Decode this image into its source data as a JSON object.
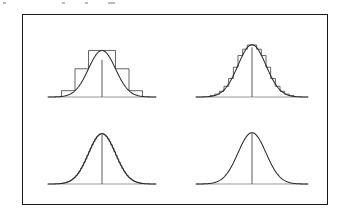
{
  "figure": {
    "domain_note": "statistical figure: normal density approximated by histograms of decreasing bin width",
    "border_color": "#1a1a1a",
    "curve_color": "#2b2b2b",
    "hist_color": "#4a4a4a",
    "axis_color": "#8c8c8c",
    "background_color": "#ffffff",
    "panel_count": 4
  },
  "caption_specks": [
    {
      "left": 3,
      "width": 3
    },
    {
      "left": 62,
      "width": 3
    },
    {
      "left": 85,
      "width": 3
    },
    {
      "left": 108,
      "width": 7
    }
  ],
  "chart_data": [
    {
      "id": "panel-top-left",
      "type": "area",
      "title": "",
      "xlabel": "",
      "ylabel": "",
      "position": "top-left",
      "grid": false,
      "legend": null,
      "axis_baseline_y": 0,
      "xlim": [
        -4,
        4
      ],
      "ylim": [
        0,
        0.42
      ],
      "curve": {
        "name": "normal density",
        "distribution": "normal",
        "mean": 0,
        "sd": 1,
        "peak_value": 0.3989
      },
      "center_line": {
        "x": 0,
        "y_top": 0.3192
      },
      "histogram": {
        "name": "coarse histogram",
        "bin_width": 1.0,
        "bin_count": 6,
        "bin_edges": [
          -3,
          -2,
          -1,
          0,
          1,
          2,
          3
        ],
        "bin_heights": [
          0.054,
          0.242,
          0.3989,
          0.3989,
          0.242,
          0.054
        ]
      }
    },
    {
      "id": "panel-top-right",
      "type": "area",
      "title": "",
      "xlabel": "",
      "ylabel": "",
      "position": "top-right",
      "grid": false,
      "legend": null,
      "axis_baseline_y": 0,
      "xlim": [
        -4,
        4
      ],
      "ylim": [
        0,
        0.42
      ],
      "curve": {
        "name": "normal density",
        "distribution": "normal",
        "mean": 0,
        "sd": 1,
        "peak_value": 0.3989
      },
      "center_line": {
        "x": 0,
        "y_top": 0.379
      },
      "histogram": {
        "name": "medium histogram",
        "bin_width": 0.3333,
        "bin_count": 18,
        "bin_edges": [
          -3.0,
          -2.667,
          -2.333,
          -2.0,
          -1.667,
          -1.333,
          -1.0,
          -0.667,
          -0.333,
          0.0,
          0.333,
          0.667,
          1.0,
          1.333,
          1.667,
          2.0,
          2.333,
          2.667,
          3.0
        ],
        "bin_heights": [
          0.0104,
          0.0219,
          0.044,
          0.0818,
          0.1417,
          0.2275,
          0.3166,
          0.3652,
          0.397,
          0.397,
          0.3652,
          0.3166,
          0.2275,
          0.1417,
          0.0818,
          0.044,
          0.0219,
          0.0104
        ]
      }
    },
    {
      "id": "panel-bottom-left",
      "type": "area",
      "title": "",
      "xlabel": "",
      "ylabel": "",
      "position": "bottom-left",
      "grid": false,
      "legend": null,
      "axis_baseline_y": 0,
      "xlim": [
        -4,
        4
      ],
      "ylim": [
        0,
        0.42
      ],
      "curve": {
        "name": "normal density",
        "distribution": "normal",
        "mean": 0,
        "sd": 1,
        "peak_value": 0.3989
      },
      "center_line": {
        "x": 0,
        "y_top": 0.395
      },
      "histogram": {
        "name": "fine histogram",
        "bin_width": 0.1176,
        "bin_count": 51,
        "bin_edges": [],
        "bin_heights": []
      }
    },
    {
      "id": "panel-bottom-right",
      "type": "area",
      "title": "",
      "xlabel": "",
      "ylabel": "",
      "position": "bottom-right",
      "grid": false,
      "legend": null,
      "axis_baseline_y": 0,
      "xlim": [
        -4,
        4
      ],
      "ylim": [
        0,
        0.42
      ],
      "curve": {
        "name": "normal density",
        "distribution": "normal",
        "mean": 0,
        "sd": 1,
        "peak_value": 0.3989
      },
      "center_line": {
        "x": 0,
        "y_top": 0.3989
      },
      "histogram": {
        "name": "limiting smooth density (no visible bins)",
        "bin_width": 0,
        "bin_count": 0,
        "bin_edges": [],
        "bin_heights": []
      }
    }
  ]
}
